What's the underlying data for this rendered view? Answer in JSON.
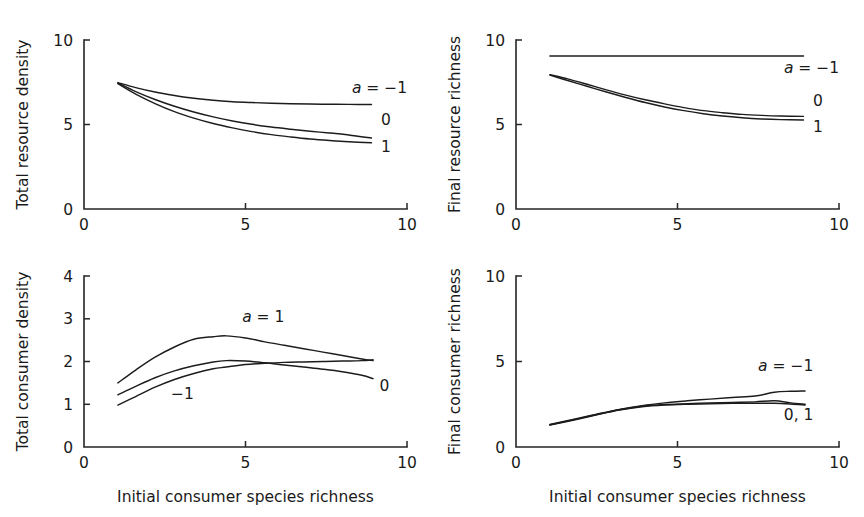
{
  "figure": {
    "panel_count": 4,
    "background_color": "#ffffff",
    "line_color": "#1c1c1c",
    "text_color": "#1a1a1a"
  },
  "chart_data": [
    {
      "id": "total-resource-density",
      "position": "top-left",
      "type": "line",
      "title": "",
      "xlabel": "",
      "ylabel": "Total resource density",
      "xlim": [
        0,
        10
      ],
      "ylim": [
        0,
        10
      ],
      "xticks": [
        0,
        5,
        10
      ],
      "xticklabels": [
        "0",
        "5",
        "10"
      ],
      "yticks": [
        0,
        5,
        10
      ],
      "yticklabels": [
        "0",
        "5",
        "10"
      ],
      "grid": false,
      "legend_position": "inline-right",
      "x": [
        1.05,
        1.6,
        2.2,
        2.8,
        3.4,
        4.0,
        4.6,
        5.2,
        5.8,
        6.4,
        7.0,
        7.6,
        8.2,
        8.9
      ],
      "series": [
        {
          "name": "a = -1",
          "label": "a = −1",
          "label_italic_prefix": "a",
          "label_rest": " = −1",
          "values": [
            7.48,
            7.18,
            6.92,
            6.72,
            6.55,
            6.43,
            6.35,
            6.3,
            6.26,
            6.23,
            6.21,
            6.2,
            6.19,
            6.18
          ]
        },
        {
          "name": "0",
          "label": "0",
          "values": [
            7.45,
            6.95,
            6.48,
            6.08,
            5.74,
            5.45,
            5.21,
            5.01,
            4.85,
            4.72,
            4.6,
            4.5,
            4.38,
            4.2
          ]
        },
        {
          "name": "1",
          "label": "1",
          "values": [
            7.42,
            6.8,
            6.24,
            5.76,
            5.38,
            5.06,
            4.8,
            4.58,
            4.4,
            4.26,
            4.14,
            4.05,
            3.98,
            3.92
          ]
        }
      ],
      "series_label_positions": [
        {
          "label_index": 0,
          "x": 9.15,
          "y": 6.85
        },
        {
          "label_index": 1,
          "x": 9.35,
          "y": 4.95
        },
        {
          "label_index": 2,
          "x": 9.35,
          "y": 3.35
        }
      ]
    },
    {
      "id": "final-resource-richness",
      "position": "top-right",
      "type": "line",
      "title": "",
      "xlabel": "",
      "ylabel": "Final resource richness",
      "xlim": [
        0,
        10
      ],
      "ylim": [
        0,
        10
      ],
      "xticks": [
        0,
        5,
        10
      ],
      "xticklabels": [
        "0",
        "5",
        "10"
      ],
      "yticks": [
        0,
        5,
        10
      ],
      "yticklabels": [
        "0",
        "5",
        "10"
      ],
      "grid": false,
      "legend_position": "inline-right",
      "x": [
        1.05,
        1.6,
        2.2,
        2.8,
        3.4,
        4.0,
        4.6,
        5.2,
        5.8,
        6.4,
        7.0,
        7.6,
        8.2,
        8.9
      ],
      "series": [
        {
          "name": "a = -1",
          "label": "a = −1",
          "label_italic_prefix": "a",
          "label_rest": " = −1",
          "values": [
            9.05,
            9.05,
            9.05,
            9.05,
            9.05,
            9.05,
            9.05,
            9.05,
            9.05,
            9.05,
            9.05,
            9.05,
            9.05,
            9.05
          ]
        },
        {
          "name": "0",
          "label": "0",
          "values": [
            7.95,
            7.7,
            7.38,
            7.05,
            6.74,
            6.46,
            6.22,
            6.0,
            5.82,
            5.7,
            5.6,
            5.54,
            5.5,
            5.48
          ]
        },
        {
          "name": "1",
          "label": "1",
          "values": [
            7.92,
            7.6,
            7.26,
            6.92,
            6.6,
            6.3,
            6.04,
            5.82,
            5.64,
            5.5,
            5.4,
            5.33,
            5.29,
            5.27
          ]
        }
      ],
      "series_label_positions": [
        {
          "label_index": 0,
          "x": 9.15,
          "y": 8.05
        },
        {
          "label_index": 1,
          "x": 9.35,
          "y": 6.1
        },
        {
          "label_index": 2,
          "x": 9.35,
          "y": 4.55
        }
      ]
    },
    {
      "id": "total-consumer-density",
      "position": "bottom-left",
      "type": "line",
      "title": "",
      "xlabel": "Initial consumer species richness",
      "ylabel": "Total consumer density",
      "xlim": [
        0,
        10
      ],
      "ylim": [
        0,
        4
      ],
      "xticks": [
        0,
        5,
        10
      ],
      "xticklabels": [
        "0",
        "5",
        "10"
      ],
      "yticks": [
        0,
        1,
        2,
        3,
        4
      ],
      "yticklabels": [
        "0",
        "1",
        "2",
        "3",
        "4"
      ],
      "grid": false,
      "legend_position": "inline",
      "x": [
        1.05,
        1.6,
        2.2,
        2.8,
        3.4,
        4.0,
        4.4,
        5.0,
        5.6,
        6.2,
        6.8,
        7.4,
        8.0,
        8.6,
        8.95
      ],
      "series": [
        {
          "name": "a = 1",
          "label": "a = 1",
          "label_italic_prefix": "a",
          "label_rest": " = 1",
          "values": [
            1.5,
            1.8,
            2.1,
            2.34,
            2.52,
            2.58,
            2.6,
            2.55,
            2.46,
            2.38,
            2.3,
            2.22,
            2.14,
            2.06,
            2.02
          ]
        },
        {
          "name": "0",
          "label": "0",
          "values": [
            1.22,
            1.42,
            1.62,
            1.78,
            1.9,
            1.99,
            2.02,
            2.01,
            1.97,
            1.92,
            1.87,
            1.82,
            1.76,
            1.68,
            1.6
          ]
        },
        {
          "name": "-1",
          "label": "−1",
          "values": [
            0.98,
            1.18,
            1.4,
            1.58,
            1.72,
            1.83,
            1.87,
            1.93,
            1.96,
            1.98,
            1.99,
            2.0,
            2.01,
            2.02,
            2.04
          ]
        }
      ],
      "series_label_positions": [
        {
          "label_index": 0,
          "x": 5.55,
          "y": 2.92
        },
        {
          "label_index": 1,
          "x": 9.3,
          "y": 1.3
        },
        {
          "label_index": 2,
          "x": 3.05,
          "y": 1.12
        }
      ]
    },
    {
      "id": "final-consumer-richness",
      "position": "bottom-right",
      "type": "line",
      "title": "",
      "xlabel": "Initial consumer species richness",
      "ylabel": "Final consumer richness",
      "xlim": [
        0,
        10
      ],
      "ylim": [
        0,
        10
      ],
      "xticks": [
        0,
        5,
        10
      ],
      "xticklabels": [
        "0",
        "5",
        "10"
      ],
      "yticks": [
        0,
        5,
        10
      ],
      "yticklabels": [
        "0",
        "5",
        "10"
      ],
      "grid": false,
      "legend_position": "inline-right",
      "x": [
        1.05,
        1.8,
        2.5,
        3.2,
        3.9,
        4.6,
        5.3,
        6.0,
        6.7,
        7.4,
        8.0,
        8.5,
        8.95
      ],
      "series": [
        {
          "name": "a = -1",
          "label": "a = −1",
          "label_italic_prefix": "a",
          "label_rest": " = −1",
          "values": [
            1.32,
            1.62,
            1.92,
            2.2,
            2.42,
            2.58,
            2.7,
            2.8,
            2.9,
            2.98,
            3.2,
            3.26,
            3.28
          ]
        },
        {
          "name": "0, 1",
          "label": "0, 1",
          "values": [
            1.3,
            1.6,
            1.9,
            2.18,
            2.38,
            2.48,
            2.53,
            2.57,
            2.6,
            2.64,
            2.7,
            2.58,
            2.5
          ]
        },
        {
          "name": "0, 1 lower",
          "label": "",
          "values": [
            1.28,
            1.58,
            1.88,
            2.16,
            2.35,
            2.45,
            2.5,
            2.53,
            2.55,
            2.56,
            2.56,
            2.52,
            2.46
          ]
        }
      ],
      "series_label_positions": [
        {
          "label_index": 0,
          "x": 8.35,
          "y": 4.45
        },
        {
          "label_index": 1,
          "x": 8.75,
          "y": 1.6
        }
      ]
    }
  ]
}
